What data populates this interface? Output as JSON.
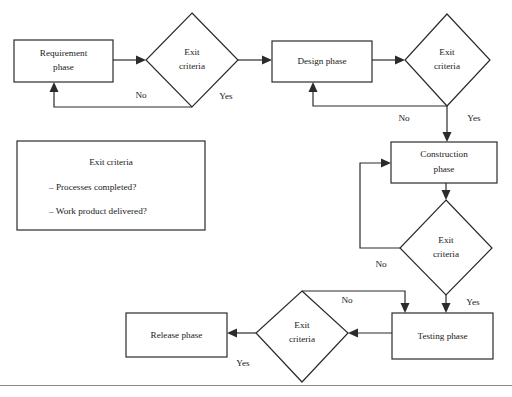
{
  "diagram": {
    "type": "flowchart",
    "nodes": [
      {
        "id": "requirement_phase",
        "shape": "rectangle",
        "label_line1": "Requirement",
        "label_line2": "phase"
      },
      {
        "id": "exit_criteria_1",
        "shape": "diamond",
        "label_line1": "Exit",
        "label_line2": "criteria"
      },
      {
        "id": "design_phase",
        "shape": "rectangle",
        "label_line1": "Design phase",
        "label_line2": ""
      },
      {
        "id": "exit_criteria_2",
        "shape": "diamond",
        "label_line1": "Exit",
        "label_line2": "criteria"
      },
      {
        "id": "construction_phase",
        "shape": "rectangle",
        "label_line1": "Construction",
        "label_line2": "phase"
      },
      {
        "id": "exit_criteria_3",
        "shape": "diamond",
        "label_line1": "Exit",
        "label_line2": "criteria"
      },
      {
        "id": "testing_phase",
        "shape": "rectangle",
        "label_line1": "Testing phase",
        "label_line2": ""
      },
      {
        "id": "exit_criteria_4",
        "shape": "diamond",
        "label_line1": "Exit",
        "label_line2": "criteria"
      },
      {
        "id": "release_phase",
        "shape": "rectangle",
        "label_line1": "Release phase",
        "label_line2": ""
      }
    ],
    "edge_labels": {
      "no_1": "No",
      "yes_1": "Yes",
      "no_2": "No",
      "yes_2": "Yes",
      "no_3": "No",
      "yes_3": "Yes",
      "no_4": "No",
      "yes_4": "Yes"
    },
    "edges": [
      {
        "from": "requirement_phase",
        "to": "exit_criteria_1",
        "label": ""
      },
      {
        "from": "exit_criteria_1",
        "to": "requirement_phase",
        "label": "No"
      },
      {
        "from": "exit_criteria_1",
        "to": "design_phase",
        "label": "Yes"
      },
      {
        "from": "design_phase",
        "to": "exit_criteria_2",
        "label": ""
      },
      {
        "from": "exit_criteria_2",
        "to": "design_phase",
        "label": "No"
      },
      {
        "from": "exit_criteria_2",
        "to": "construction_phase",
        "label": "Yes"
      },
      {
        "from": "construction_phase",
        "to": "exit_criteria_3",
        "label": ""
      },
      {
        "from": "exit_criteria_3",
        "to": "construction_phase",
        "label": "No"
      },
      {
        "from": "exit_criteria_3",
        "to": "testing_phase",
        "label": "Yes"
      },
      {
        "from": "testing_phase",
        "to": "exit_criteria_4",
        "label": ""
      },
      {
        "from": "exit_criteria_4",
        "to": "testing_phase",
        "label": "No"
      },
      {
        "from": "exit_criteria_4",
        "to": "release_phase",
        "label": "Yes"
      }
    ]
  },
  "legend": {
    "title": "Exit criteria",
    "items": [
      "– Processes completed?",
      "– Work product delivered?"
    ]
  },
  "colors": {
    "stroke": "#2b2b2b",
    "fill": "#ffffff",
    "text": "#1a1a1a",
    "rule": "#8a8a8a"
  }
}
